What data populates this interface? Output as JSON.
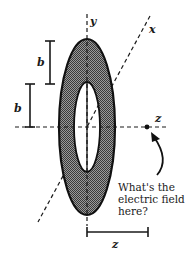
{
  "figure": {
    "type": "annulus-electric-field-diagram",
    "background": "#ffffff",
    "ink_color": "#1a1a1a",
    "fill_color": "#7a7a7a",
    "axes": {
      "y_label": "y",
      "x_label": "x",
      "z_label": "z"
    },
    "dimensions": {
      "inner_radius_label": "b",
      "ring_width_label": "b",
      "distance_label": "z"
    },
    "annotation": {
      "line1": "What's the",
      "line2": "electric field",
      "line3": "here?"
    },
    "point_marker": "field-point"
  }
}
